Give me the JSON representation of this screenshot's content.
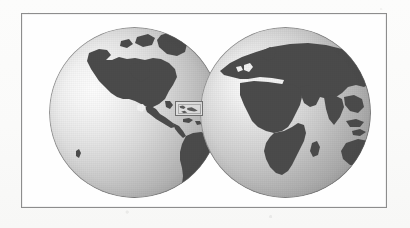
{
  "figure": {
    "kind": "world-map-two-hemispheres",
    "caption": "",
    "frame": {
      "border_color": "#8d8d8d",
      "fill_color": "#fefefe"
    },
    "background_color": "#fbfbfa"
  },
  "legend": {
    "ocean_color": "#c8c8c8",
    "land_color": "#4b4b4b",
    "ice_color": "#f2f2f2",
    "highlight_color": "#6e6e6e"
  },
  "globes": [
    {
      "id": "western-hemisphere",
      "label": "Western Hemisphere",
      "center_lon": "90 W",
      "center_lat": "0",
      "visible_landmasses": [
        "North America",
        "Central America",
        "South America",
        "Greenland",
        "Caribbean Islands",
        "Antarctica"
      ],
      "visible_oceans": [
        "Pacific Ocean",
        "Atlantic Ocean"
      ]
    },
    {
      "id": "eastern-hemisphere",
      "label": "Eastern Hemisphere",
      "center_lon": "30 E",
      "center_lat": "0",
      "visible_landmasses": [
        "Europe",
        "Africa",
        "Asia",
        "Arabian Peninsula",
        "India",
        "Madagascar",
        "Indonesia",
        "Australia",
        "Antarctica"
      ],
      "visible_oceans": [
        "Atlantic Ocean",
        "Indian Ocean",
        "Mediterranean Sea"
      ]
    }
  ],
  "highlight": {
    "id": "region-of-interest",
    "label": "Caribbean / Central America detail box",
    "shape": "rectangle",
    "x": 153,
    "y": 87,
    "width": 28,
    "height": 15
  }
}
